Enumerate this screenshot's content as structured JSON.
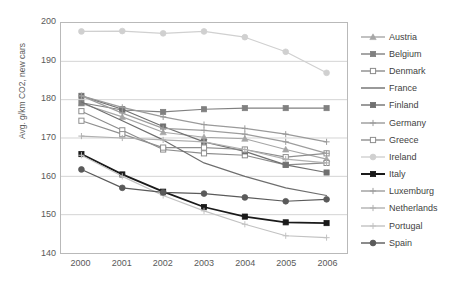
{
  "chart_data": {
    "type": "line",
    "title": "",
    "xlabel": "",
    "ylabel": "Avg. g/km CO2, new cars",
    "x": [
      2000,
      2001,
      2002,
      2003,
      2004,
      2005,
      2006
    ],
    "categories": [
      "2000",
      "2001",
      "2002",
      "2003",
      "2004",
      "2005",
      "2006"
    ],
    "ylim": [
      140,
      200
    ],
    "yticks": [
      140,
      150,
      160,
      170,
      180,
      190,
      200
    ],
    "grid": true,
    "legend_position": "right",
    "series": [
      {
        "name": "Austria",
        "color": "#a6a6a6",
        "marker": "triangle",
        "values": [
          179.0,
          175.5,
          171.5,
          170.2,
          169.8,
          167.0,
          164.5
        ]
      },
      {
        "name": "Belgium",
        "color": "#808080",
        "marker": "square",
        "values": [
          179.2,
          177.3,
          176.8,
          177.5,
          177.8,
          177.8,
          177.8
        ]
      },
      {
        "name": "Denmark",
        "color": "#8c8c8c",
        "marker": "square-open",
        "values": [
          177.0,
          172.0,
          167.0,
          166.0,
          165.5,
          163.0,
          163.5
        ]
      },
      {
        "name": "France",
        "color": "#6e6e6e",
        "marker": "none",
        "values": [
          179.4,
          174.5,
          169.5,
          163.5,
          160.0,
          157.0,
          155.0
        ]
      },
      {
        "name": "Finland",
        "color": "#707070",
        "marker": "square",
        "values": [
          181.0,
          177.5,
          173.0,
          169.0,
          166.5,
          163.0,
          161.0
        ]
      },
      {
        "name": "Germany",
        "color": "#9a9a9a",
        "marker": "plus",
        "values": [
          181.0,
          178.0,
          175.5,
          173.5,
          172.5,
          171.0,
          169.0
        ]
      },
      {
        "name": "Greece",
        "color": "#8f8f8f",
        "marker": "square-open",
        "values": [
          174.5,
          171.0,
          167.5,
          167.5,
          167.0,
          165.0,
          166.0
        ]
      },
      {
        "name": "Ireland",
        "color": "#d0d0d0",
        "marker": "circle",
        "values": [
          197.8,
          197.9,
          197.3,
          197.8,
          196.3,
          192.5,
          187.0
        ]
      },
      {
        "name": "Italy",
        "color": "#1a1a1a",
        "marker": "square",
        "values": [
          165.8,
          160.5,
          156.0,
          152.0,
          149.5,
          148.0,
          147.8
        ]
      },
      {
        "name": "Luxemburg",
        "color": "#9d9d9d",
        "marker": "plus",
        "values": [
          181.0,
          176.5,
          172.5,
          172.0,
          171.0,
          169.0,
          166.0
        ]
      },
      {
        "name": "Netherlands",
        "color": "#b0b0b0",
        "marker": "plus",
        "values": [
          170.5,
          170.0,
          169.5,
          169.0,
          167.0,
          164.5,
          163.5
        ]
      },
      {
        "name": "Portugal",
        "color": "#c2c2c2",
        "marker": "plus",
        "values": [
          165.5,
          160.0,
          155.0,
          151.0,
          147.5,
          144.5,
          144.0
        ]
      },
      {
        "name": "Spain",
        "color": "#5a5a5a",
        "marker": "circle",
        "values": [
          161.8,
          157.0,
          155.8,
          155.5,
          154.5,
          153.5,
          154.0
        ]
      }
    ]
  },
  "legend": {
    "items": [
      {
        "label": "Austria"
      },
      {
        "label": "Belgium"
      },
      {
        "label": "Denmark"
      },
      {
        "label": "France"
      },
      {
        "label": "Finland"
      },
      {
        "label": "Germany"
      },
      {
        "label": "Greece"
      },
      {
        "label": "Ireland"
      },
      {
        "label": "Italy"
      },
      {
        "label": "Luxemburg"
      },
      {
        "label": "Netherlands"
      },
      {
        "label": "Portugal"
      },
      {
        "label": "Spain"
      }
    ]
  }
}
